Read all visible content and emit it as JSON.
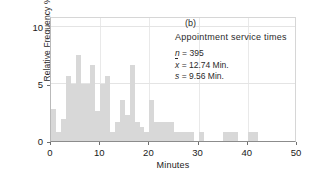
{
  "chart_data": {
    "type": "bar",
    "title": "Appointment service times",
    "panel_label": "(b)",
    "xlabel": "Minutes",
    "ylabel": "Relative Frequency %",
    "xlim": [
      0,
      50
    ],
    "ylim": [
      0,
      11
    ],
    "xticks": [
      0,
      10,
      20,
      30,
      40,
      50
    ],
    "yticks": [
      0,
      5,
      10
    ],
    "grid": true,
    "legend_position": "none",
    "bin_width": 1,
    "bar_color": "#d8d8d8",
    "bin_starts": [
      0,
      1,
      2,
      3,
      4,
      5,
      6,
      7,
      8,
      9,
      10,
      11,
      12,
      13,
      14,
      15,
      16,
      17,
      18,
      19,
      20,
      21,
      22,
      23,
      24,
      25,
      26,
      27,
      28,
      29,
      30,
      31,
      32,
      33,
      34,
      35,
      36,
      37,
      38,
      39,
      40,
      41
    ],
    "values": [
      2.8,
      0.8,
      1.9,
      5.7,
      5.0,
      7.6,
      5.0,
      5.0,
      6.7,
      2.6,
      5.0,
      5.7,
      0.8,
      1.7,
      3.6,
      2.3,
      6.7,
      1.7,
      1.2,
      0.8,
      3.6,
      1.7,
      1.7,
      1.7,
      1.7,
      0.8,
      0.8,
      0.8,
      0.8,
      0.0,
      0.8,
      0.0,
      0.0,
      0.0,
      0.0,
      0.8,
      0.8,
      0.8,
      0.0,
      0.0,
      0.8,
      0.8
    ],
    "annotations": {
      "n_symbol": "n",
      "n_value": "395",
      "mean_symbol": "x",
      "mean_value": "12.74 Min.",
      "sd_symbol": "s",
      "sd_value": "9.56 Min.",
      "equals": "=",
      "n_line": "n = 395",
      "mean_line": "x = 12.74 Min.",
      "sd_line": "s = 9.56 Min."
    }
  }
}
